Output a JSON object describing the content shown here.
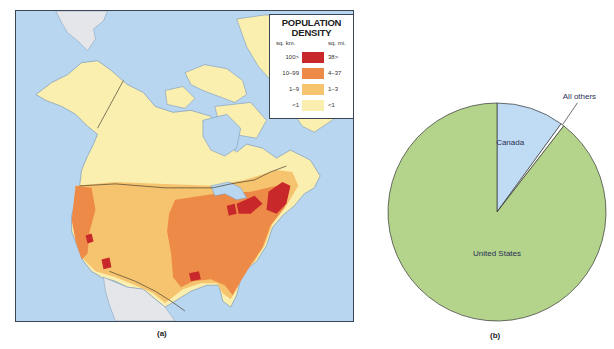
{
  "panel_a": {
    "caption": "(a)",
    "legend": {
      "title_line1": "POPULATION",
      "title_line2": "DENSITY",
      "unit_km": "sq. km.",
      "unit_mi": "sq. mi.",
      "rows": [
        {
          "km": "100>",
          "mi": "38>",
          "color": "#c8282a"
        },
        {
          "km": "10–99",
          "mi": "4–37",
          "color": "#ee8a48"
        },
        {
          "km": "1–9",
          "mi": "1–3",
          "color": "#f6c46e"
        },
        {
          "km": "<1",
          "mi": "<1",
          "color": "#fbefb0"
        }
      ]
    },
    "colors": {
      "water": "#b8d6f0",
      "land_low": "#fbefb0",
      "land_mid": "#f6c46e",
      "land_high": "#ee8a48",
      "land_max": "#c8282a",
      "other_land": "#e4e6ea",
      "border": "#4a4030"
    }
  },
  "chart_data": {
    "type": "pie",
    "title": "",
    "caption": "(b)",
    "start_angle": "12 o'clock",
    "direction": "clockwise",
    "slices": [
      {
        "label": "Canada",
        "value": 10,
        "color": "#c0dcf4"
      },
      {
        "label": "All others",
        "value": 0.5,
        "color": "#ffffff"
      },
      {
        "label": "United States",
        "value": 89.5,
        "color": "#b4d48c"
      }
    ],
    "units": "percent of area (approx.)"
  }
}
